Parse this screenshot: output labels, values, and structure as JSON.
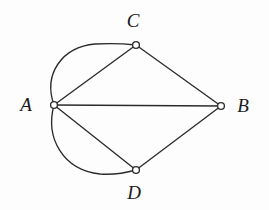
{
  "figure": {
    "background_color": "#fdfdfd",
    "stroke_color": "#2b2b2b",
    "node_fill_color": "#ffffff",
    "width": 269,
    "height": 210
  },
  "graph": {
    "type": "multigraph",
    "vertices": [
      {
        "id": "A",
        "label": "A",
        "cx": 54,
        "cy": 105,
        "r": 3.4,
        "label_x": 26,
        "label_y": 104
      },
      {
        "id": "B",
        "label": "B",
        "cx": 221,
        "cy": 106,
        "r": 3.4,
        "label_x": 243,
        "label_y": 105
      },
      {
        "id": "C",
        "label": "C",
        "cx": 136,
        "cy": 45,
        "r": 3.4,
        "label_x": 133,
        "label_y": 20
      },
      {
        "id": "D",
        "label": "D",
        "cx": 136,
        "cy": 170,
        "r": 3.4,
        "label_x": 134,
        "label_y": 192
      }
    ],
    "edges": [
      {
        "id": "A-B",
        "from": "A",
        "to": "B",
        "shape": "straight",
        "path": "M 54 105 L 221 106"
      },
      {
        "id": "A-C-1",
        "from": "A",
        "to": "C",
        "shape": "straight",
        "path": "M 54 105 L 136 45"
      },
      {
        "id": "A-C-2",
        "from": "A",
        "to": "C",
        "shape": "curved",
        "path": "M 54 105 C 43 74 62 47 95 44 C 112 43 127 44 136 45"
      },
      {
        "id": "A-D-1",
        "from": "A",
        "to": "D",
        "shape": "straight",
        "path": "M 54 105 L 136 170"
      },
      {
        "id": "A-D-2",
        "from": "A",
        "to": "D",
        "shape": "curved",
        "path": "M 54 105 C 45 138 63 170 100 174 C 116 175 129 172 136 170"
      },
      {
        "id": "C-B",
        "from": "C",
        "to": "B",
        "shape": "straight",
        "path": "M 136 45 L 221 106"
      },
      {
        "id": "D-B",
        "from": "D",
        "to": "B",
        "shape": "straight",
        "path": "M 136 170 L 221 106"
      }
    ],
    "edge_count": 7,
    "vertex_count": 4
  }
}
